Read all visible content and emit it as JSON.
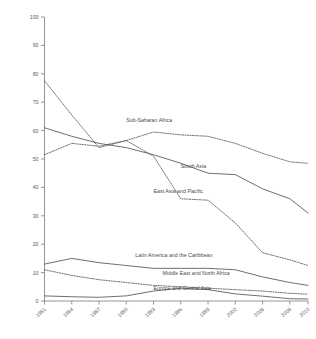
{
  "chart_data": {
    "type": "line",
    "title": "",
    "subtitle": "",
    "xlabel": "",
    "ylabel": "",
    "xlim": [
      1981,
      2010
    ],
    "ylim": [
      0,
      100
    ],
    "grid": false,
    "legend_position": "inline-labels",
    "x_tick_labels": [
      "1981",
      "1984",
      "1987",
      "1990",
      "1993",
      "1996",
      "1999",
      "2002",
      "2005",
      "2008",
      "2010"
    ],
    "x_ticks": [
      1981,
      1984,
      1987,
      1990,
      1993,
      1996,
      1999,
      2002,
      2005,
      2008,
      2010
    ],
    "y_tick_labels": [
      "0",
      "10",
      "20",
      "30",
      "40",
      "50",
      "60",
      "70",
      "80",
      "90",
      "100"
    ],
    "y_ticks": [
      0,
      10,
      20,
      30,
      40,
      50,
      60,
      70,
      80,
      90,
      100
    ],
    "x": [
      1981,
      1984,
      1987,
      1990,
      1993,
      1996,
      1999,
      2002,
      2005,
      2008,
      2010
    ],
    "series": [
      {
        "name": "Sub-Saharan Africa",
        "style": "dashed",
        "label_x": 1990,
        "label_y": 63,
        "values": [
          51.5,
          55.5,
          54.5,
          56.5,
          59.5,
          58.5,
          58.0,
          55.5,
          52.0,
          49.0,
          48.5
        ]
      },
      {
        "name": "South Asia",
        "style": "solid",
        "label_x": 1996,
        "label_y": 47,
        "values": [
          61.0,
          58.0,
          55.5,
          54.0,
          51.5,
          48.5,
          45.0,
          44.5,
          39.5,
          36.0,
          31.0
        ]
      },
      {
        "name": "East Asia and Pacific",
        "style": "dashed",
        "label_x": 1993,
        "label_y": 38,
        "values": [
          77.5,
          65.5,
          54.0,
          56.5,
          51.0,
          36.0,
          35.5,
          27.5,
          17.0,
          14.5,
          12.5
        ]
      },
      {
        "name": "Latin America and the Caribbean",
        "style": "solid",
        "label_x": 1991,
        "label_y": 15.5,
        "values": [
          13.0,
          15.0,
          13.5,
          12.5,
          11.5,
          11.5,
          11.5,
          11.0,
          8.5,
          6.5,
          5.5
        ]
      },
      {
        "name": "Middle East and North Africa",
        "style": "dashed",
        "label_x": 1994,
        "label_y": 9.0,
        "values": [
          11.0,
          9.0,
          7.5,
          6.5,
          5.5,
          5.0,
          4.5,
          4.0,
          3.5,
          2.7,
          2.4
        ]
      },
      {
        "name": "Europe and Central Asia",
        "style": "solid",
        "label_x": 1993,
        "label_y": 4.0,
        "values": [
          1.8,
          1.5,
          1.3,
          1.8,
          3.5,
          4.5,
          4.0,
          2.5,
          1.7,
          0.8,
          0.7
        ]
      }
    ]
  }
}
